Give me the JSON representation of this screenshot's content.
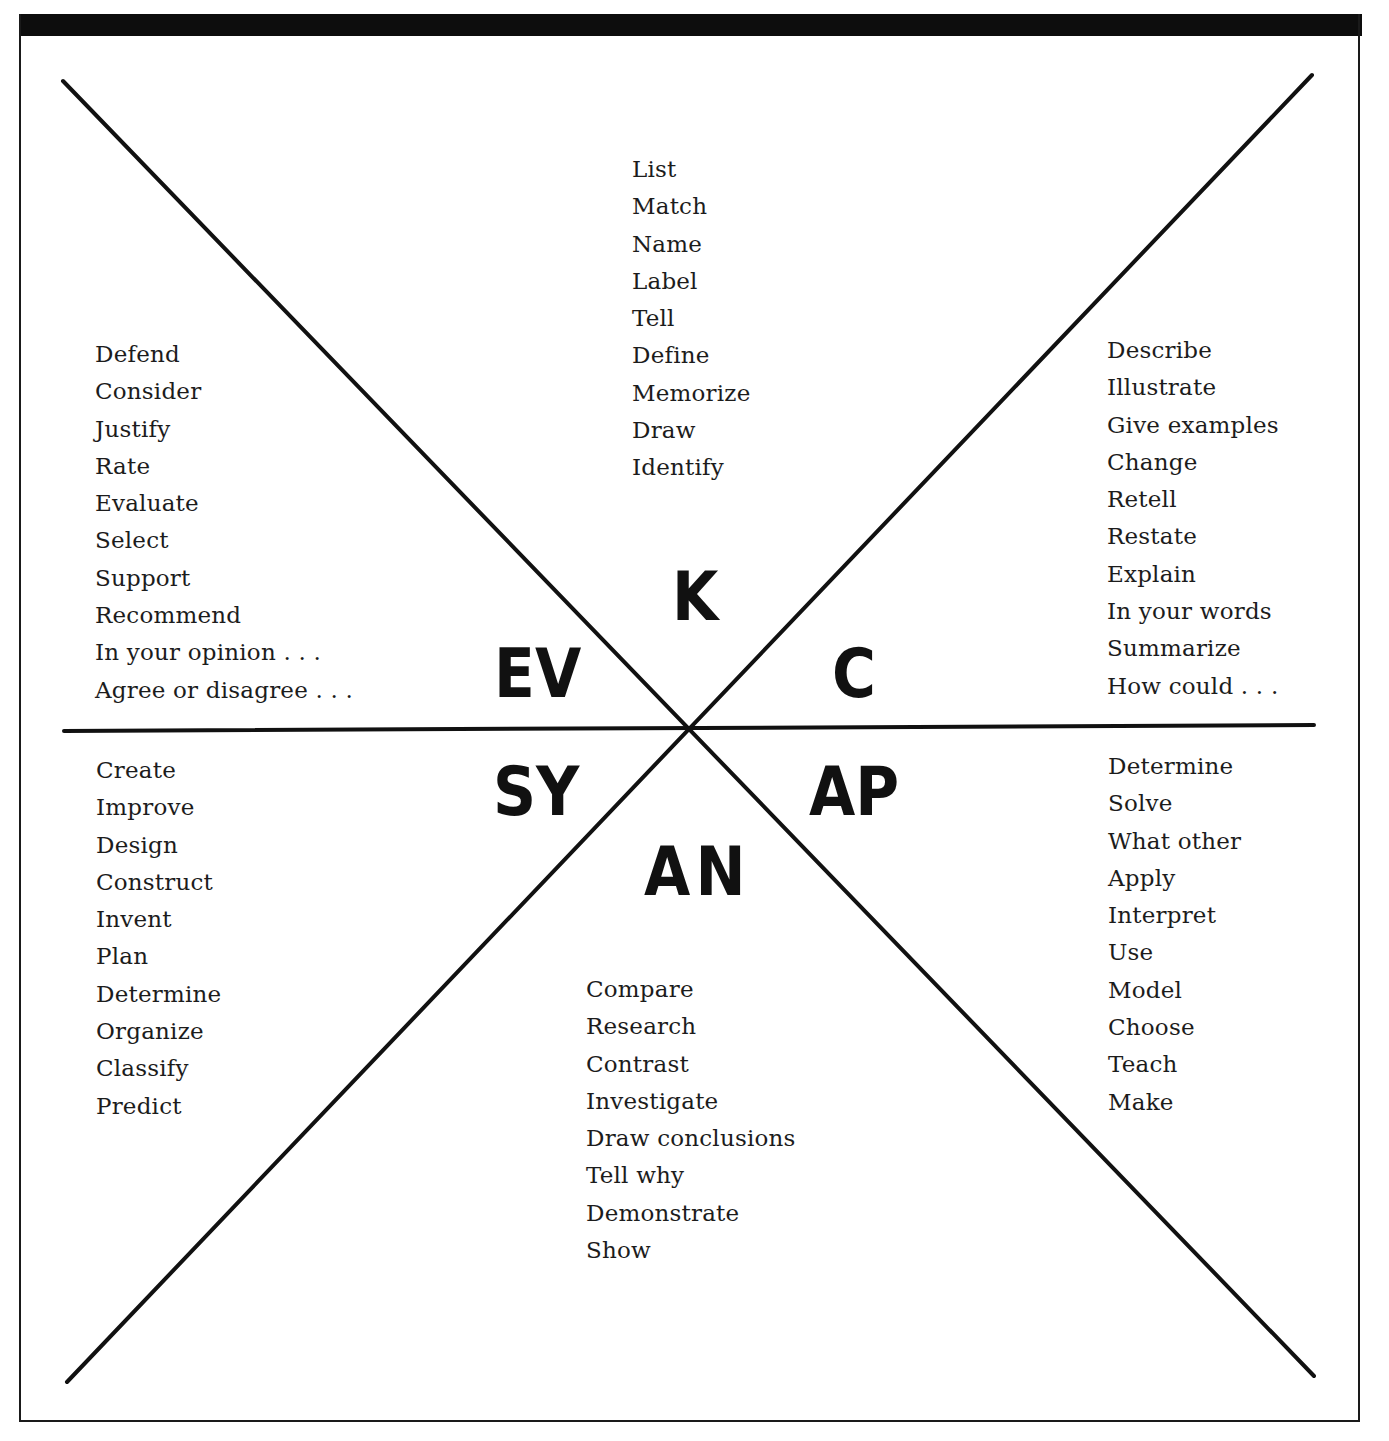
{
  "diagram": {
    "type": "six-sector thinking-levels chart",
    "sectors": [
      {
        "id": "knowledge",
        "abbr": "K",
        "position": "top",
        "words": [
          "List",
          "Match",
          "Name",
          "Label",
          "Tell",
          "Define",
          "Memorize",
          "Draw",
          "Identify"
        ]
      },
      {
        "id": "comprehension",
        "abbr": "C",
        "position": "upper-right",
        "words": [
          "Describe",
          "Illustrate",
          "Give examples",
          "Change",
          "Retell",
          "Restate",
          "Explain",
          "In your words",
          "Summarize",
          "How could . . ."
        ]
      },
      {
        "id": "application",
        "abbr": "AP",
        "position": "lower-right",
        "words": [
          "Determine",
          "Solve",
          "What other",
          "Apply",
          "Interpret",
          "Use",
          "Model",
          "Choose",
          "Teach",
          "Make"
        ]
      },
      {
        "id": "analysis",
        "abbr": "AN",
        "position": "bottom",
        "words": [
          "Compare",
          "Research",
          "Contrast",
          "Investigate",
          "Draw conclusions",
          "Tell why",
          "Demonstrate",
          "Show"
        ]
      },
      {
        "id": "synthesis",
        "abbr": "SY",
        "position": "lower-left",
        "words": [
          "Create",
          "Improve",
          "Design",
          "Construct",
          "Invent",
          "Plan",
          "Determine",
          "Organize",
          "Classify",
          "Predict"
        ]
      },
      {
        "id": "evaluation",
        "abbr": "EV",
        "position": "upper-left",
        "words": [
          "Defend",
          "Consider",
          "Justify",
          "Rate",
          "Evaluate",
          "Select",
          "Support",
          "Recommend",
          "In your opinion . . .",
          "Agree or disagree . . ."
        ]
      }
    ],
    "colors": {
      "ink": "#111111",
      "background": "#ffffff"
    }
  }
}
